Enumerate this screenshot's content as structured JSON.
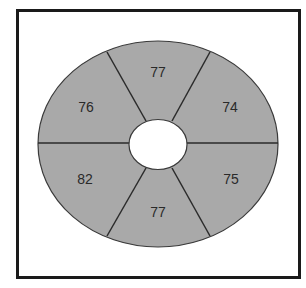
{
  "diagram": {
    "type": "ring-sector-diagram",
    "fill_color": "#a9a9a9",
    "line_color": "#2b2b2b",
    "border_color": "#1a1a1a",
    "segments": [
      {
        "position": "top",
        "value": "77"
      },
      {
        "position": "upper-right",
        "value": "74"
      },
      {
        "position": "lower-right",
        "value": "75"
      },
      {
        "position": "bottom",
        "value": "77"
      },
      {
        "position": "lower-left",
        "value": "82"
      },
      {
        "position": "upper-left",
        "value": "76"
      }
    ]
  }
}
